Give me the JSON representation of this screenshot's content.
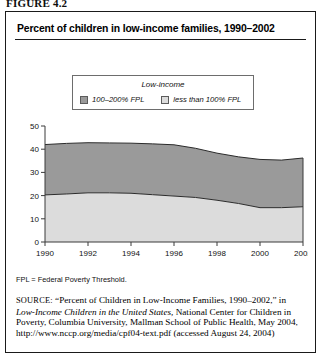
{
  "figure": {
    "number_label": "FIGURE 4.2",
    "title": "Percent of children in low-income families, 1990–2002"
  },
  "legend": {
    "title": "Low-income",
    "items": [
      {
        "label": "100–200% FPL",
        "color": "#9a9a9a"
      },
      {
        "label": "less than 100% FPL",
        "color": "#dcdcdc"
      }
    ]
  },
  "notes": {
    "abbreviation": "FPL = Federal Poverty Threshold.",
    "source_label": "SOURCE:",
    "source_part1": " “Percent of Children in Low-Income Families, 1990–2002,” in ",
    "source_italic": "Low-Income Children in the United States,",
    "source_part2": " National Center for Children in Poverty, Columbia University, Mallman School of Public Health, May 2004, http://www.nccp.org/media/cpf04-text.pdf (accessed August 24, 2004)"
  },
  "chart_data": {
    "type": "area",
    "title": "Percent of children in low-income families, 1990–2002",
    "xlabel": "",
    "ylabel": "",
    "stacked": true,
    "grid": false,
    "legend_position": "top-center",
    "xlim": [
      1990,
      2002
    ],
    "ylim": [
      0,
      50
    ],
    "yticks": [
      0,
      10,
      20,
      30,
      40,
      50
    ],
    "xticks": [
      1990,
      1992,
      1994,
      1996,
      1998,
      2000,
      2002
    ],
    "x": [
      1990,
      1991,
      1992,
      1993,
      1994,
      1995,
      1996,
      1997,
      1998,
      1999,
      2000,
      2001,
      2002
    ],
    "series": [
      {
        "name": "less than 100% FPL",
        "color": "#dcdcdc",
        "values": [
          20.3,
          20.7,
          21.2,
          21.2,
          21.0,
          20.4,
          19.8,
          19.2,
          18.0,
          16.6,
          14.8,
          14.8,
          15.2
        ]
      },
      {
        "name": "100–200% FPL",
        "color": "#9a9a9a",
        "values": [
          21.7,
          21.8,
          21.6,
          21.5,
          21.6,
          21.9,
          22.1,
          21.2,
          20.3,
          20.1,
          20.8,
          20.5,
          21.0
        ]
      }
    ],
    "totals": [
      42.0,
      42.5,
      42.8,
      42.7,
      42.6,
      42.3,
      41.9,
      40.4,
      38.3,
      36.7,
      35.6,
      35.3,
      36.2
    ]
  }
}
